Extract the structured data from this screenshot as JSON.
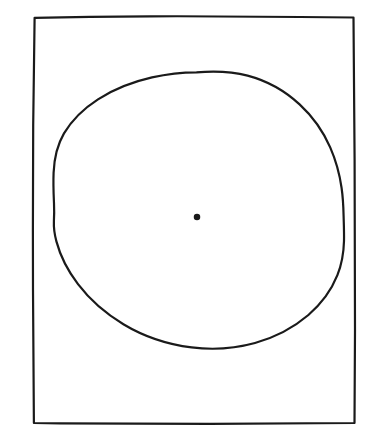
{
  "figure": {
    "title": "Hand-drawn circle inscribed in a rectangle with a marked center point",
    "medium": "pen-and-ink line drawing",
    "canvas": {
      "width": 377,
      "height": 440,
      "background_color": "#ffffff"
    },
    "ink_color": "#1a1a1a",
    "shapes": {
      "rectangle": {
        "label": "outer frame rectangle",
        "left": 33,
        "top": 16,
        "right": 355,
        "bottom": 424,
        "width": 322,
        "height": 408,
        "stroke_width": 2.2,
        "style": "hand-drawn, slightly wavering straight edges",
        "path": "M 34.5 17.5 L 120 16.6 L 210 16.2 L 300 16.9 L 353.6 17.4 L 354.2 110 L 354.8 210 L 355.0 320 L 354.6 423.0 L 260 423.6 L 160 424.0 L 70 423.4 L 33.8 423.0 L 33.2 330 L 32.9 230 L 33.4 130 L 34.5 17.5 Z"
      },
      "circle": {
        "label": "hand-drawn circle",
        "center_x": 198,
        "center_y": 218,
        "radius": 145.5,
        "top_y": 72,
        "bottom_y": 363,
        "left_x": 53,
        "right_x": 344,
        "stroke_width": 2.2,
        "style": "freehand, irregular — flattened near upper-right, small kink on left edge",
        "path": "M 196 72.4 C 178 72.6 160 75.4 143 80.6 C 120 87.6 99 99.0 83 114.0 C 68 128.2 58.6 145.4 55.4 164.2 C 53.2 177.2 53.0 190.4 53.6 203.6 C 54.0 212.0 54.4 216.6 53.9 224.0 C 53.5 230.4 55.2 237.0 57.2 243.6 C 62.0 259.6 70.4 274.8 81.6 288.2 C 98.2 308.4 120.6 324.8 145.6 335.8 C 162.0 343.0 179.4 347.4 197.0 348.0"
      },
      "center_dot": {
        "label": "center point marker",
        "center_x": 197,
        "center_y": 217,
        "diameter": 6.5,
        "fill": "#1a1a1a"
      }
    }
  }
}
